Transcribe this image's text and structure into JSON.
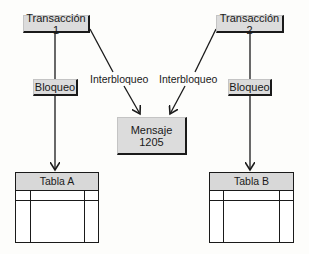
{
  "diagram": {
    "transactions": [
      {
        "label": "Transacción 1"
      },
      {
        "label": "Transacción 2"
      }
    ],
    "locks": [
      {
        "label": "Bloqueo"
      },
      {
        "label": "Bloqueo"
      }
    ],
    "deadlock_labels": [
      {
        "label": "Interbloqueo"
      },
      {
        "label": "Interbloqueo"
      }
    ],
    "message": {
      "line1": "Mensaje",
      "line2": "1205"
    },
    "tables": [
      {
        "label": "Tabla A"
      },
      {
        "label": "Tabla B"
      }
    ],
    "colors": {
      "box_fill": "#dcdcdc",
      "line": "#1a1a1a",
      "background": "#fdfdfb"
    }
  }
}
